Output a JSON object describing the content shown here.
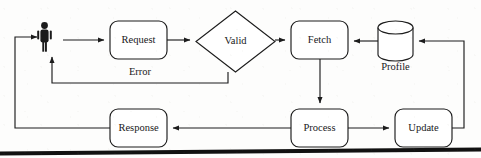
{
  "diagram": {
    "type": "flowchart",
    "orientation": "left-to-right with feedback loops",
    "nodes": [
      {
        "id": "actor",
        "label": "",
        "shape": "person-icon",
        "x": 43,
        "y": 40,
        "w": 14,
        "h": 26
      },
      {
        "id": "request",
        "label": "Request",
        "shape": "rounded-rectangle",
        "x": 110,
        "y": 21,
        "w": 57,
        "h": 38
      },
      {
        "id": "valid",
        "label": "Valid",
        "shape": "diamond",
        "x": 196,
        "y": 11,
        "w": 79,
        "h": 61
      },
      {
        "id": "fetch",
        "label": "Fetch",
        "shape": "rounded-rectangle",
        "x": 291,
        "y": 21,
        "w": 57,
        "h": 38
      },
      {
        "id": "profile",
        "label": "Profile",
        "shape": "cylinder",
        "x": 378,
        "y": 22,
        "w": 35,
        "h": 38
      },
      {
        "id": "response",
        "label": "Response",
        "shape": "rounded-rectangle",
        "x": 110,
        "y": 109,
        "w": 57,
        "h": 38
      },
      {
        "id": "process",
        "label": "Process",
        "shape": "rounded-rectangle",
        "x": 291,
        "y": 109,
        "w": 57,
        "h": 38
      },
      {
        "id": "update",
        "label": "Update",
        "shape": "rounded-rectangle",
        "x": 395,
        "y": 109,
        "w": 57,
        "h": 38
      }
    ],
    "edges": [
      {
        "id": "e-actor-request",
        "from": "actor",
        "to": "request",
        "label": "",
        "arrow": true
      },
      {
        "id": "e-request-valid",
        "from": "request",
        "to": "valid",
        "label": "",
        "arrow": true
      },
      {
        "id": "e-valid-fetch",
        "from": "valid",
        "to": "fetch",
        "label": "",
        "arrow": true
      },
      {
        "id": "e-valid-actor",
        "from": "valid",
        "to": "actor",
        "label": "Error",
        "arrow": true
      },
      {
        "id": "e-profile-fetch",
        "from": "profile",
        "to": "fetch",
        "label": "",
        "arrow": true
      },
      {
        "id": "e-fetch-process",
        "from": "fetch",
        "to": "process",
        "label": "",
        "arrow": true
      },
      {
        "id": "e-process-response",
        "from": "process",
        "to": "response",
        "label": "",
        "arrow": true
      },
      {
        "id": "e-process-update",
        "from": "process",
        "to": "update",
        "label": "",
        "arrow": true
      },
      {
        "id": "e-update-profile",
        "from": "update",
        "to": "profile",
        "label": "",
        "arrow": true
      },
      {
        "id": "e-response-actor",
        "from": "response",
        "to": "actor",
        "label": "",
        "arrow": true
      }
    ],
    "labels": {
      "error": "Error",
      "profile_caption": "Profile"
    },
    "colors": {
      "background": "#fdfdfc",
      "stroke": "#1c1c1c",
      "node_fill": "#ffffff",
      "text": "#18181a",
      "actor_fill": "#1b1b1b",
      "page_edge": "#111111"
    }
  }
}
